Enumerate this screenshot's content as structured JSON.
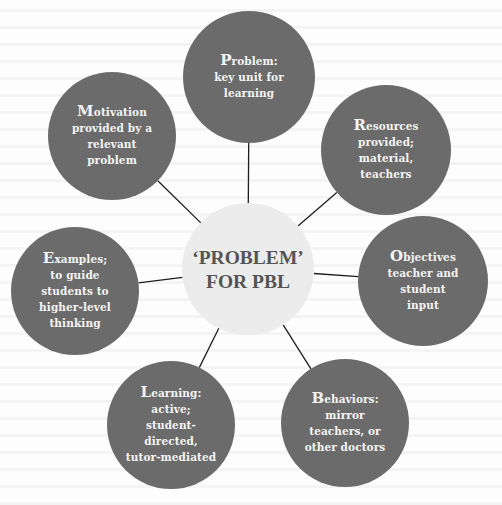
{
  "diagram": {
    "type": "hub-and-spoke",
    "colors": {
      "outer_fill": "#6b6b6b",
      "outer_text": "#f4f4f4",
      "hub_fill": "#ececec",
      "hub_text": "#555555",
      "line": "#1e1e1e"
    },
    "hub": {
      "cx": 248,
      "cy": 269,
      "r": 66,
      "lines": [
        "‘PROBLEM’",
        "FOR PBL"
      ]
    },
    "nodes": [
      {
        "id": "problem",
        "cx": 249,
        "cy": 77,
        "r": 66,
        "lines": [
          "Problem:",
          "key unit for",
          "learning"
        ]
      },
      {
        "id": "resources",
        "cx": 386,
        "cy": 150,
        "r": 65,
        "lines": [
          "Resources",
          "provided;",
          "material,",
          "teachers"
        ]
      },
      {
        "id": "objectives",
        "cx": 423,
        "cy": 281,
        "r": 65,
        "lines": [
          "Objectives",
          "teacher and",
          "student",
          "input"
        ]
      },
      {
        "id": "behaviors",
        "cx": 345,
        "cy": 423,
        "r": 64,
        "lines": [
          "Behaviors:",
          "mirror",
          "teachers, or",
          "other doctors"
        ]
      },
      {
        "id": "learning",
        "cx": 171,
        "cy": 425,
        "r": 64,
        "lines": [
          "Learning:",
          "active;",
          "student-",
          "directed,",
          "tutor-mediated"
        ]
      },
      {
        "id": "examples",
        "cx": 75,
        "cy": 291,
        "r": 64,
        "lines": [
          "Examples;",
          "to guide",
          "students to",
          "higher-level",
          "thinking"
        ]
      },
      {
        "id": "motivation",
        "cx": 112,
        "cy": 136,
        "r": 64,
        "lines": [
          "Motivation",
          "provided by a",
          "relevant",
          "problem"
        ]
      }
    ]
  }
}
